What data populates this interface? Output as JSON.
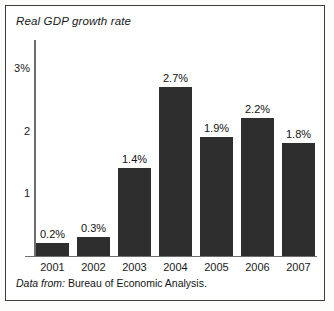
{
  "chart_data": {
    "type": "bar",
    "title": "Real GDP growth rate",
    "xlabel": "",
    "ylabel": "",
    "categories": [
      "2001",
      "2002",
      "2003",
      "2004",
      "2005",
      "2006",
      "2007"
    ],
    "values": [
      0.2,
      0.3,
      1.4,
      2.7,
      1.9,
      2.2,
      1.8
    ],
    "value_labels": [
      "0.2%",
      "0.3%",
      "1.4%",
      "2.7%",
      "1.9%",
      "2.2%",
      "1.8%"
    ],
    "ylim": [
      0,
      3.45
    ],
    "yticks": [
      1,
      2,
      3
    ],
    "ytick_labels": [
      "1",
      "2",
      "3%"
    ],
    "grid": false,
    "legend": null,
    "bar_color": "#2e2e2e",
    "axis_color": "#6e6e6e",
    "border_color": "#3d3d3d"
  },
  "source": {
    "prefix": "Data from:",
    "body": " Bureau of Economic Analysis."
  }
}
